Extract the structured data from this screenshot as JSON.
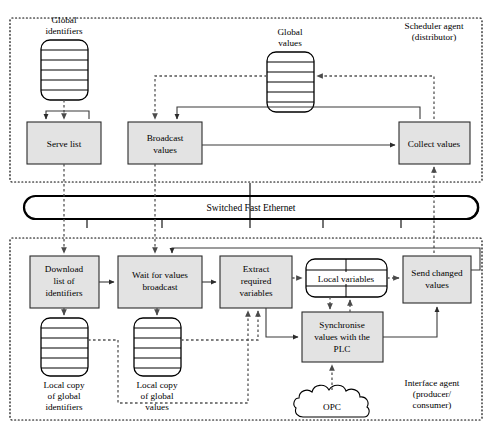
{
  "network": {
    "label": "Switched Fast Ethernet",
    "name": "switched-fast-ethernet-bus"
  },
  "regions": [
    {
      "id": "scheduler",
      "label_line1": "Scheduler agent",
      "label_line2": "(distributor)"
    },
    {
      "id": "interface",
      "label_line1": "Interface agent",
      "label_line2": "(producer/",
      "label_line3": "consumer)"
    }
  ],
  "scheduler": {
    "stores": [
      {
        "id": "global-identifiers",
        "label_line1": "Global",
        "label_line2": "identifiers",
        "label_pos": "above"
      },
      {
        "id": "global-values",
        "label_line1": "Global",
        "label_line2": "values",
        "label_pos": "above"
      }
    ],
    "processes": [
      {
        "id": "serve-list",
        "line1": "Serve list"
      },
      {
        "id": "broadcast-values",
        "line1": "Broadcast",
        "line2": "values"
      },
      {
        "id": "collect-values",
        "line1": "Collect values"
      }
    ]
  },
  "interface": {
    "processes": [
      {
        "id": "download-list-of-identifiers",
        "line1": "Download",
        "line2": "list of",
        "line3": "identifiers"
      },
      {
        "id": "wait-for-values-broadcast",
        "line1": "Wait for values",
        "line2": "broadcast"
      },
      {
        "id": "extract-required-variables",
        "line1": "Extract",
        "line2": "required",
        "line3": "variables"
      },
      {
        "id": "synchronise-values-with-the-plc",
        "line1": "Synchronise",
        "line2": "values with the",
        "line3": "PLC"
      },
      {
        "id": "send-changed-values",
        "line1": "Send changed",
        "line2": "values"
      }
    ],
    "stores": [
      {
        "id": "local-copy-of-global-identifiers",
        "label_line1": "Local copy",
        "label_line2": "of global",
        "label_line3": "identifiers",
        "label_pos": "below"
      },
      {
        "id": "local-copy-of-global-values",
        "label_line1": "Local copy",
        "label_line2": "of global",
        "label_line3": "values",
        "label_pos": "below"
      }
    ],
    "variables_store": {
      "id": "local-variables",
      "label": "Local variables"
    },
    "external": {
      "id": "opc",
      "label": "OPC",
      "shape": "cloud"
    }
  },
  "colors": {
    "process_fill": "#e3e3e3",
    "stroke": "#2b2b2b",
    "store_fill": "#ffffff",
    "solid_flow": "#3a3a3a",
    "dashed_flow": "#555555",
    "background": "#ffffff"
  }
}
